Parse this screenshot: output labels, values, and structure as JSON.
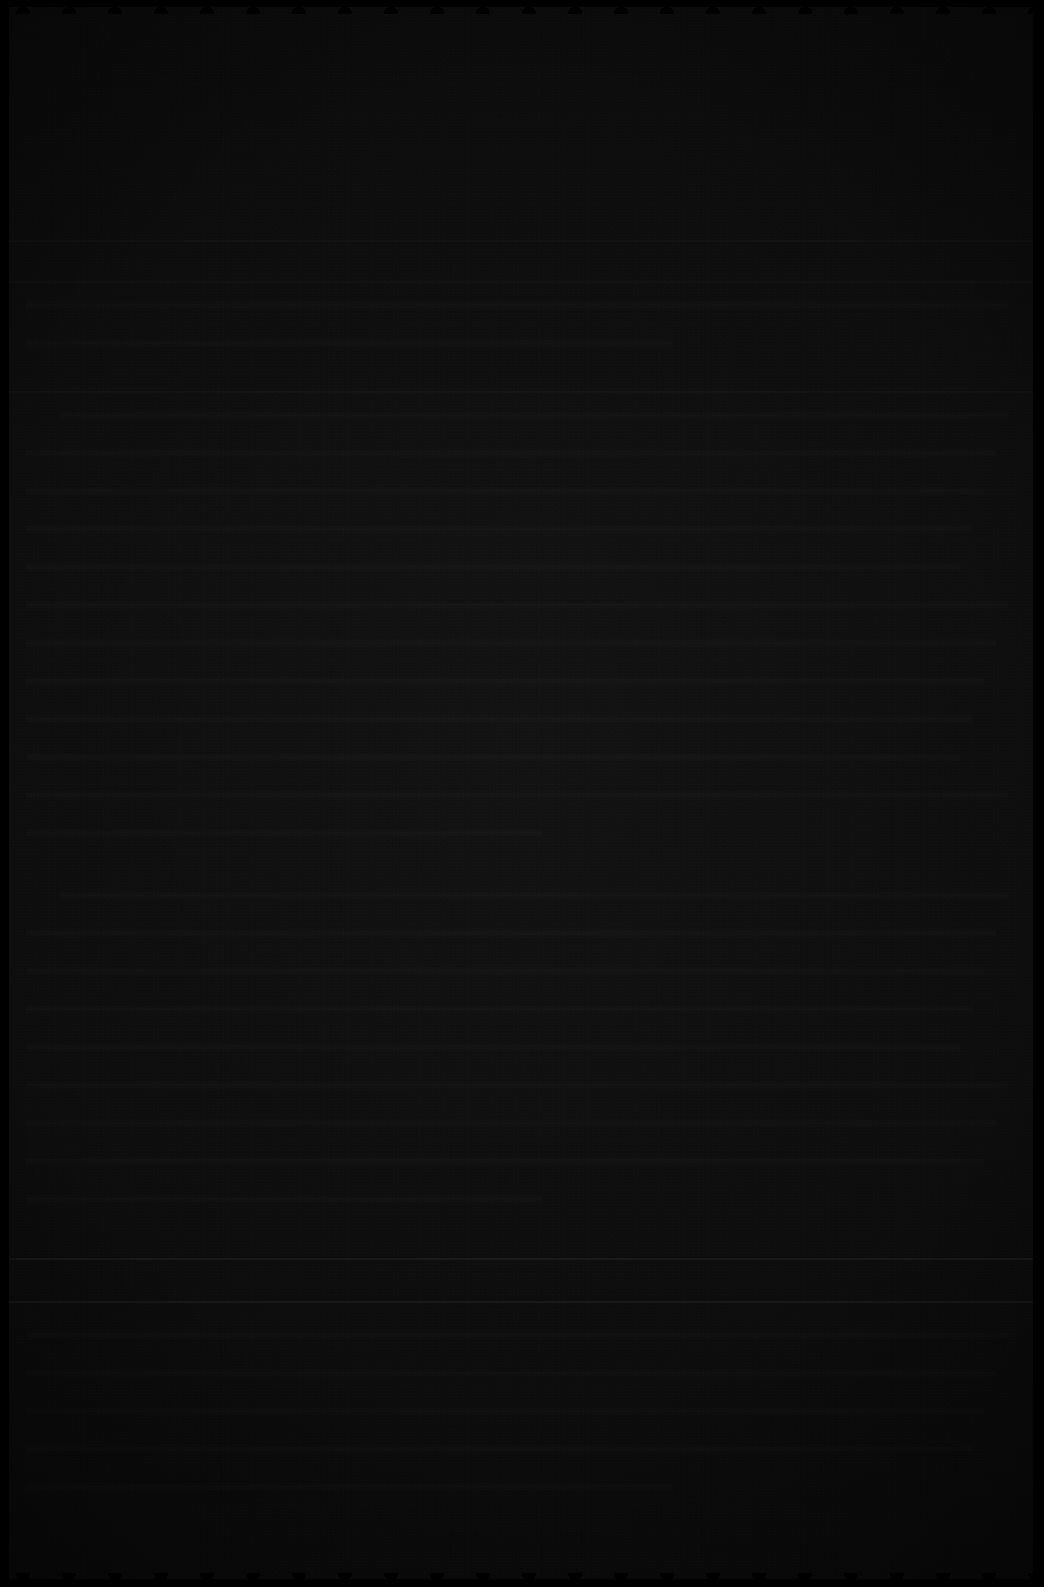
{
  "page": {
    "kind": "scanned-document-page",
    "legibility": "none",
    "legibility_note": "Image is a severely under-exposed scan; no text, heading, number or caption is resolvable at any magnification.",
    "orientation": "portrait",
    "width_px": 1044,
    "height_px": 1587,
    "has_color": false,
    "readable_text": []
  },
  "palette": {
    "page_base": "#1b1b1b",
    "page_light": "#1e1e1e",
    "page_dark": "#171717",
    "edge_black": "#000000",
    "rule_stroke": "rgba(255,255,255,0.105)",
    "ghost_text": "rgba(255,255,255,0.030)"
  },
  "edges": {
    "note": "Scanner page-edge artifact: solid black borders with a scalloped/serrated profile on all four sides.",
    "left_px": 9,
    "right_px": 11,
    "top_px": 7,
    "bottom_px": 8,
    "scallop_period_horizontal_px": 46,
    "scallop_period_vertical_px": 52
  },
  "rules": [
    {
      "name": "faint-rule-upper",
      "y": 240,
      "weight": "faint"
    },
    {
      "name": "faint-rule-upper2",
      "y": 281,
      "weight": "faint"
    },
    {
      "name": "faint-rule-mid",
      "y": 391,
      "weight": "faint"
    },
    {
      "name": "footer-rule-top",
      "y": 1258,
      "weight": "strong"
    },
    {
      "name": "footer-rule-bottom",
      "y": 1301,
      "weight": "strong"
    }
  ],
  "text_bands": {
    "note": "Regular horizontal banding consistent with body text lines; individual glyphs are not recoverable.",
    "line_pitch_px": 38,
    "left_margin_px": 26,
    "right_margin_px": 26,
    "blocks": [
      {
        "name": "block-upper",
        "top": 300,
        "lines": 2,
        "indents": [
          0,
          0
        ]
      },
      {
        "name": "block-body-1",
        "top": 410,
        "lines": 12,
        "indents": [
          34,
          0,
          0,
          0,
          0,
          0,
          0,
          0,
          0,
          0,
          0,
          0
        ]
      },
      {
        "name": "block-body-2",
        "top": 890,
        "lines": 9,
        "indents": [
          34,
          0,
          0,
          0,
          0,
          0,
          0,
          0,
          0
        ]
      },
      {
        "name": "block-footer",
        "top": 1330,
        "lines": 5,
        "indents": [
          0,
          0,
          0,
          0,
          0
        ]
      }
    ]
  }
}
